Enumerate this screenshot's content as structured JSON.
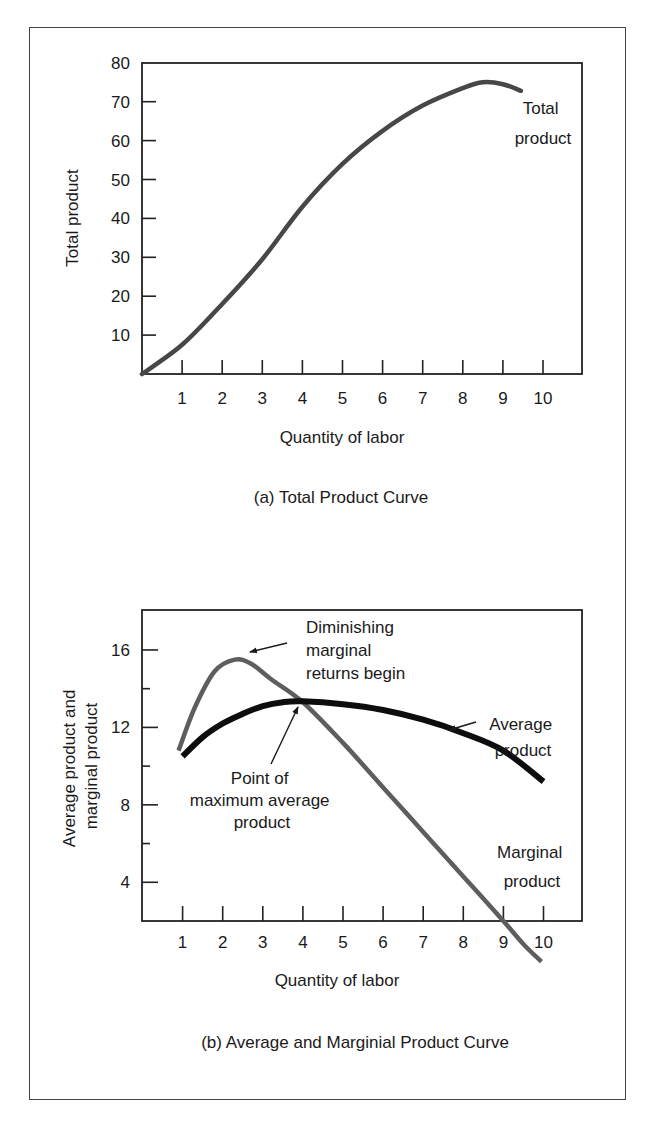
{
  "figure": {
    "captions": {
      "a": "(a) Total Product Curve",
      "b": "(b) Average and Marginial Product Curve"
    }
  },
  "colors": {
    "total_product": "#474747",
    "marginal_product": "#5e5e5e",
    "average_product": "#0d0d0d",
    "axis": "#222222",
    "frame": "#444444"
  },
  "chart_data": [
    {
      "type": "line",
      "title": "(a) Total Product Curve",
      "xlabel": "Quantity of labor",
      "ylabel": "Total product",
      "xlim": [
        0,
        11
      ],
      "ylim": [
        0,
        80
      ],
      "xticks": [
        1,
        2,
        3,
        4,
        5,
        6,
        7,
        8,
        9,
        10
      ],
      "yticks": [
        10,
        20,
        30,
        40,
        50,
        60,
        70,
        80
      ],
      "grid": false,
      "series": [
        {
          "name": "Total product",
          "x": [
            0,
            1,
            2,
            3,
            4,
            5,
            6,
            7,
            8,
            8.5,
            9,
            9.45
          ],
          "y": [
            0,
            7.5,
            18,
            29.5,
            43,
            54,
            62.5,
            69,
            73.5,
            75,
            74.5,
            72.8
          ]
        }
      ],
      "annotations": [
        {
          "text_lines": [
            "Total",
            "product"
          ],
          "x": 9.5,
          "y": 68
        }
      ]
    },
    {
      "type": "line",
      "title": "(b) Average and Marginial Product Curve",
      "xlabel": "Quantity of labor",
      "ylabel_lines": [
        "Average product and",
        "marginal product"
      ],
      "xlim": [
        0,
        11
      ],
      "ylim": [
        2,
        18
      ],
      "xticks": [
        1,
        2,
        3,
        4,
        5,
        6,
        7,
        8,
        9,
        10
      ],
      "yticks_labeled": [
        4,
        8,
        12,
        16
      ],
      "yticks_minor": [
        6,
        10,
        14
      ],
      "grid": false,
      "series": [
        {
          "name": "Marginal product",
          "x": [
            0.9,
            1.3,
            1.8,
            2.3,
            2.7,
            3.2,
            4,
            5,
            6,
            7,
            8,
            9,
            9.5,
            9.95
          ],
          "y": [
            10.8,
            13,
            14.9,
            15.5,
            15.3,
            14.5,
            13.3,
            11.2,
            8.9,
            6.6,
            4.3,
            2,
            0.8,
            -0.1
          ]
        },
        {
          "name": "Average product",
          "x": [
            1,
            1.5,
            2,
            2.5,
            3,
            3.5,
            4,
            5,
            6,
            7,
            8,
            9,
            10
          ],
          "y": [
            10.5,
            11.5,
            12.2,
            12.7,
            13.1,
            13.3,
            13.35,
            13.2,
            12.9,
            12.4,
            11.7,
            10.8,
            9.2
          ]
        }
      ],
      "annotations": [
        {
          "text_lines": [
            "Diminishing",
            "marginal",
            "returns begin"
          ],
          "arrow_to": [
            2.6,
            15.6
          ]
        },
        {
          "text_lines": [
            "Point of",
            "maximum average",
            "product"
          ],
          "arrow_to": [
            4,
            13.3
          ]
        },
        {
          "text_lines": [
            "Average",
            "product"
          ],
          "arrow_to": [
            7.6,
            12
          ]
        },
        {
          "text_lines": [
            "Marginal",
            "product"
          ],
          "x": 9.3,
          "y": 4
        }
      ]
    }
  ]
}
